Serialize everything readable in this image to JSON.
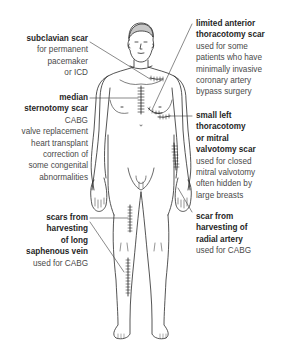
{
  "diagram": {
    "type": "anatomical-figure",
    "line_color": "#2a2a2a",
    "text_color": "#4a4a4a",
    "title_color": "#1f1f1f"
  },
  "labels": {
    "subclavian": {
      "title": "subclavian scar",
      "desc": [
        "for permanent",
        "pacemaker",
        "or ICD"
      ]
    },
    "median": {
      "title": [
        "median",
        "sternotomy scar"
      ],
      "desc": [
        "CABG",
        "valve replacement",
        "heart transplant",
        "correction of",
        "some congenital",
        "abnormalities"
      ]
    },
    "saphenous": {
      "title": [
        "scars from",
        "harvesting",
        "of long",
        "saphenous vein"
      ],
      "desc": [
        "used for CABG"
      ]
    },
    "limited_anterior": {
      "title": [
        "limited anterior",
        "thoracotomy scar"
      ],
      "desc": [
        "used for some",
        "patients who have",
        "minimally invasive",
        "coronary artery",
        "bypass surgery"
      ]
    },
    "small_left": {
      "title": [
        "small left",
        "thoracotomy",
        "or mitral",
        "valvotomy scar"
      ],
      "desc": [
        "used for closed",
        "mitral valvotomy",
        "often hidden by",
        "large breasts"
      ]
    },
    "radial": {
      "title": [
        "scar from",
        "harvesting of",
        "radial artery"
      ],
      "desc": [
        "used for CABG"
      ]
    }
  }
}
